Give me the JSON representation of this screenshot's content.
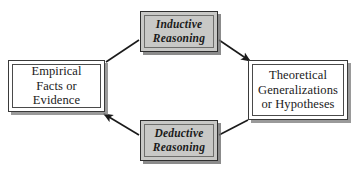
{
  "diagram": {
    "background_color": "#ffffff",
    "shaded_fill": "#c8c8c6",
    "plain_fill": "#ffffff",
    "line_color": "#1a1a1a",
    "nodes": [
      {
        "id": "empirical",
        "label": "Empirical\nFacts or\nEvidence",
        "style": "plain",
        "position": "left"
      },
      {
        "id": "inductive",
        "label": "Inductive\nReasoning",
        "style": "shaded",
        "position": "top"
      },
      {
        "id": "theoretical",
        "label": "Theoretical\nGeneralizations\nor Hypotheses",
        "style": "plain",
        "position": "right"
      },
      {
        "id": "deductive",
        "label": "Deductive\nReasoning",
        "style": "shaded",
        "position": "bottom"
      }
    ],
    "connectors": [
      {
        "id": "empirical-to-inductive",
        "from": "empirical",
        "to": "inductive",
        "arrowhead": "none"
      },
      {
        "id": "inductive-to-theoretical",
        "from": "inductive",
        "to": "theoretical",
        "arrowhead": "end"
      },
      {
        "id": "theoretical-to-deductive",
        "from": "theoretical",
        "to": "deductive",
        "arrowhead": "none"
      },
      {
        "id": "deductive-to-empirical",
        "from": "deductive",
        "to": "empirical",
        "arrowhead": "end"
      }
    ]
  }
}
